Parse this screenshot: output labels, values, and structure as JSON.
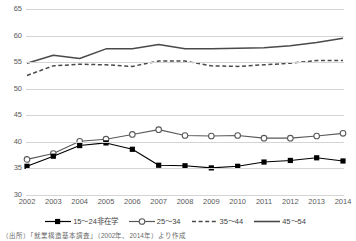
{
  "chart_data": {
    "type": "line",
    "title": "",
    "subtitle": "",
    "xlabel": "",
    "ylabel": "",
    "categories": [
      "2002",
      "2003",
      "2004",
      "2005",
      "2006",
      "2007",
      "2008",
      "2009",
      "2010",
      "2011",
      "2012",
      "2013",
      "2014"
    ],
    "ylim": [
      30,
      65
    ],
    "yticks": [
      30,
      35,
      40,
      45,
      50,
      55,
      60,
      65
    ],
    "grid": true,
    "legend_position": "bottom",
    "series": [
      {
        "name": "15～24非在学",
        "marker": "filled-square",
        "line": "solid",
        "color": "#000000",
        "values": [
          35.4,
          37.3,
          39.3,
          39.8,
          38.6,
          35.6,
          35.5,
          35.1,
          35.4,
          36.2,
          36.5,
          37.0,
          36.4
        ]
      },
      {
        "name": "25～34",
        "marker": "open-circle",
        "line": "solid",
        "color": "#595959",
        "values": [
          36.7,
          37.8,
          40.1,
          40.5,
          41.4,
          42.3,
          41.2,
          41.1,
          41.2,
          40.7,
          40.7,
          41.1,
          41.6
        ]
      },
      {
        "name": "35～44",
        "marker": "none",
        "line": "dashed",
        "color": "#4a4a4a",
        "values": [
          52.5,
          54.3,
          54.6,
          54.5,
          54.2,
          55.2,
          55.2,
          54.3,
          54.2,
          54.5,
          54.8,
          55.3,
          55.3
        ]
      },
      {
        "name": "45～54",
        "marker": "none",
        "line": "solid",
        "color": "#4a4a4a",
        "values": [
          54.8,
          56.3,
          55.7,
          57.5,
          57.5,
          58.3,
          57.5,
          57.5,
          57.6,
          57.7,
          58.1,
          58.7,
          59.5
        ]
      }
    ]
  },
  "source_note": "（出所）「就業構造基本調査」（2002年、2014年）より作成"
}
